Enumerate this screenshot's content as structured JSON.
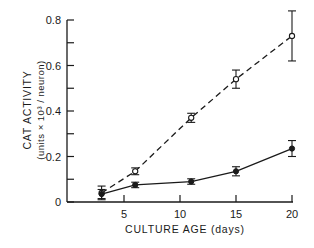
{
  "chart_data": {
    "type": "line",
    "title": "",
    "xlabel": "CULTURE AGE (days)",
    "ylabel": "CAT ACTIVITY",
    "ylabel_units": "(units × 10³ / neuron)",
    "xlim": [
      0,
      20
    ],
    "ylim": [
      0,
      0.8
    ],
    "x_ticks": [
      5,
      10,
      15,
      20
    ],
    "x_tick_labels": [
      "5",
      "10",
      "15",
      "20"
    ],
    "y_ticks": [
      0,
      0.2,
      0.4,
      0.6,
      0.8
    ],
    "y_tick_labels": [
      "0",
      "0.2",
      "0.4",
      "0.6",
      "0.8"
    ],
    "y_minor_ticks": [
      0.1,
      0.3,
      0.5,
      0.7
    ],
    "grid": false,
    "legend": "none",
    "series": [
      {
        "name": "open circles (dashed)",
        "marker": "open-circle",
        "line_style": "dashed",
        "x": [
          3,
          6,
          11,
          15,
          20
        ],
        "y": [
          0.04,
          0.135,
          0.37,
          0.54,
          0.73
        ],
        "error": [
          0.03,
          0.015,
          0.02,
          0.04,
          0.11
        ]
      },
      {
        "name": "filled circles (solid)",
        "marker": "filled-circle",
        "line_style": "solid",
        "x": [
          3,
          6,
          11,
          15,
          20
        ],
        "y": [
          0.035,
          0.075,
          0.09,
          0.135,
          0.235
        ],
        "error": [
          0.02,
          0.012,
          0.012,
          0.02,
          0.035
        ]
      }
    ]
  }
}
